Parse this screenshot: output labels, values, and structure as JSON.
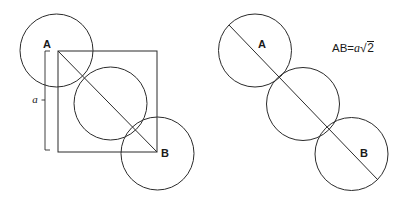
{
  "diagram": {
    "stroke_color": "#2b2b2b",
    "text_color": "#1a1a1a",
    "background_color": "#ffffff",
    "left_figure": {
      "name": "square-with-three-circles",
      "square": {
        "x": 58,
        "y": 51,
        "size": 99
      },
      "diagonal": {
        "x1": 58,
        "y1": 51,
        "x2": 157,
        "y2": 152
      },
      "circles": [
        {
          "id": "circle-a",
          "cx": 56.5,
          "cy": 50.5,
          "r": 36.5
        },
        {
          "id": "circle-middle",
          "cx": 110.5,
          "cy": 103.5,
          "r": 36.5
        },
        {
          "id": "circle-b",
          "cx": 157.5,
          "cy": 153.5,
          "r": 36.5
        }
      ],
      "labels": {
        "vertex_a": "A",
        "vertex_b": "B",
        "side_length": "a"
      },
      "side_bracket": {
        "x": 46,
        "y_top": 51,
        "y_bottom": 150
      }
    },
    "right_figure": {
      "name": "three-circles-on-line",
      "diagonal": {
        "x1": 229,
        "y1": 25,
        "x2": 378,
        "y2": 180
      },
      "circles": [
        {
          "id": "circle-a",
          "cx": 255,
          "cy": 50.5,
          "r": 36.5
        },
        {
          "id": "circle-middle",
          "cx": 303,
          "cy": 104,
          "r": 36.5
        },
        {
          "id": "circle-b",
          "cx": 351.5,
          "cy": 154,
          "r": 36.5
        }
      ],
      "labels": {
        "vertex_a": "A",
        "vertex_b": "B"
      },
      "formula": {
        "lhs": "AB",
        "equals": "=",
        "coefficient": "a",
        "radical_symbol": "√",
        "radicand": "2",
        "full_text": "AB = a√2"
      }
    }
  }
}
